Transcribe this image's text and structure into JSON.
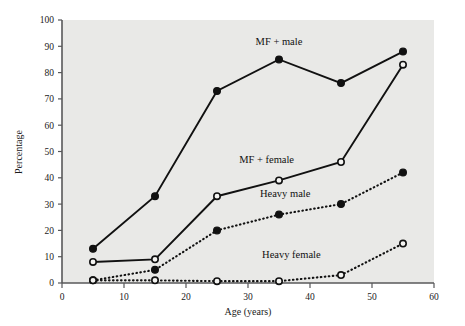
{
  "chart_data": {
    "type": "line",
    "title": "",
    "xlabel": "Age (years)",
    "ylabel": "Percentage",
    "xlim": [
      0,
      60
    ],
    "ylim": [
      0,
      100
    ],
    "xticks": [
      0,
      10,
      20,
      30,
      40,
      50,
      60
    ],
    "yticks": [
      0,
      10,
      20,
      30,
      40,
      50,
      60,
      70,
      80,
      90,
      100
    ],
    "grid": false,
    "legend_position": "inline-annotations",
    "x": [
      5,
      15,
      25,
      35,
      45,
      55
    ],
    "series": [
      {
        "name": "MF + male",
        "values": [
          13,
          33,
          73,
          85,
          76,
          88
        ],
        "linestyle": "solid",
        "marker": "filled-circle",
        "label_x": 35,
        "label_y": 92
      },
      {
        "name": "MF + female",
        "values": [
          8,
          9,
          33,
          39,
          46,
          83
        ],
        "linestyle": "solid",
        "marker": "open-circle",
        "label_x": 33,
        "label_y": 47
      },
      {
        "name": "Heavy male",
        "values": [
          1,
          5,
          20,
          26,
          30,
          42
        ],
        "linestyle": "dotted",
        "marker": "filled-circle",
        "label_x": 36,
        "label_y": 34
      },
      {
        "name": "Heavy female",
        "values": [
          1,
          1,
          0.7,
          0.7,
          3,
          15
        ],
        "linestyle": "dotted",
        "marker": "open-circle",
        "label_x": 37,
        "label_y": 11
      }
    ]
  },
  "colors": {
    "plot_background": "#e9e9e7",
    "page_background": "#ffffff",
    "axis": "#58585a",
    "ink": "#111111"
  }
}
